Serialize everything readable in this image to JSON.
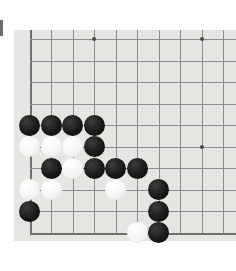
{
  "app": {
    "title": "Go Board Position",
    "canvas_width": 236,
    "canvas_height": 271
  },
  "board": {
    "name": "go-board",
    "surface_color": "#e6e5e2",
    "line_color": "#8d8d8d",
    "edge_line_color": "#6f6f6f",
    "star_point_color": "#4a4a4a",
    "black_stone_color": "#191919",
    "white_stone_color": "#fdfdfd",
    "page_background": "#ffffff",
    "edge_marker_color": "#6e6e6e",
    "surface": {
      "left": 14,
      "top": 30,
      "width": 222,
      "height": 211
    },
    "origin_x": 15.5,
    "origin_y": 9.0,
    "spacing": 21.5,
    "columns": 10,
    "rows": 10,
    "visible_edges": [
      "left",
      "bottom"
    ],
    "stone_radius": 10.5,
    "star_points": [
      {
        "col": 3,
        "row": 0,
        "label": "hoshi-upper-left"
      },
      {
        "col": 8,
        "row": 0,
        "label": "hoshi-upper-right"
      },
      {
        "col": 8,
        "row": 5,
        "label": "hoshi-right"
      }
    ],
    "stones": [
      {
        "color": "black",
        "col": 0,
        "row": 4
      },
      {
        "color": "black",
        "col": 1,
        "row": 4
      },
      {
        "color": "black",
        "col": 2,
        "row": 4
      },
      {
        "color": "black",
        "col": 3,
        "row": 4
      },
      {
        "color": "white",
        "col": 0,
        "row": 5
      },
      {
        "color": "white",
        "col": 1,
        "row": 5
      },
      {
        "color": "white",
        "col": 2,
        "row": 5
      },
      {
        "color": "black",
        "col": 3,
        "row": 5
      },
      {
        "color": "black",
        "col": 1,
        "row": 6
      },
      {
        "color": "white",
        "col": 2,
        "row": 6
      },
      {
        "color": "black",
        "col": 3,
        "row": 6
      },
      {
        "color": "black",
        "col": 4,
        "row": 6
      },
      {
        "color": "black",
        "col": 5,
        "row": 6
      },
      {
        "color": "white",
        "col": 0,
        "row": 7
      },
      {
        "color": "white",
        "col": 1,
        "row": 7
      },
      {
        "color": "white",
        "col": 4,
        "row": 7
      },
      {
        "color": "black",
        "col": 6,
        "row": 7
      },
      {
        "color": "black",
        "col": 0,
        "row": 8
      },
      {
        "color": "black",
        "col": 6,
        "row": 8
      },
      {
        "color": "white",
        "col": 5,
        "row": 9
      },
      {
        "color": "black",
        "col": 6,
        "row": 9
      }
    ],
    "counts": {
      "black_stones": 13,
      "white_stones": 8,
      "total_stones": 21
    }
  }
}
